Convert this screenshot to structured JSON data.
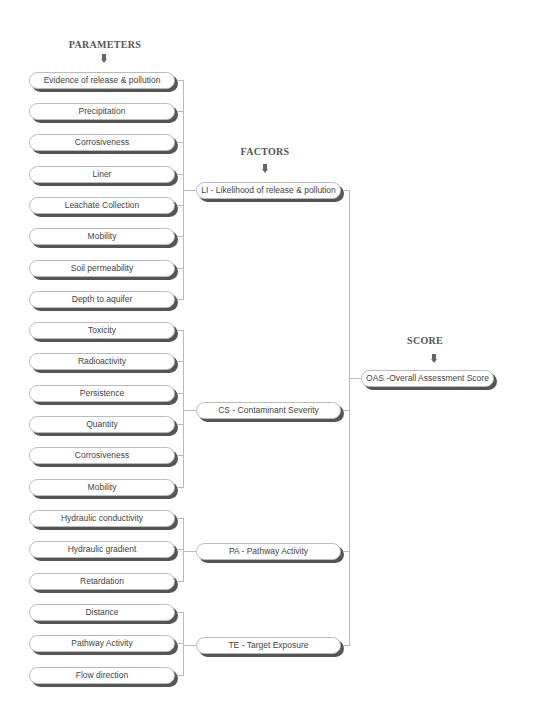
{
  "headings": {
    "parameters": "PARAMETERS",
    "factors": "FACTORS",
    "score": "SCORE"
  },
  "parameters": [
    {
      "label": "Evidence of release & pollution",
      "group": "LI"
    },
    {
      "label": "Precipitation",
      "group": "LI"
    },
    {
      "label": "Corrosiveness",
      "group": "LI"
    },
    {
      "label": "Liner",
      "group": "LI"
    },
    {
      "label": "Leachate Collection",
      "group": "LI"
    },
    {
      "label": "Mobility",
      "group": "LI"
    },
    {
      "label": "Soil permeability",
      "group": "LI"
    },
    {
      "label": "Depth to aquifer",
      "group": "LI"
    },
    {
      "label": "Toxicity",
      "group": "CS"
    },
    {
      "label": "Radioactivity",
      "group": "CS"
    },
    {
      "label": "Persistence",
      "group": "CS"
    },
    {
      "label": "Quantity",
      "group": "CS"
    },
    {
      "label": "Corrosiveness",
      "group": "CS"
    },
    {
      "label": "Mobility",
      "group": "CS"
    },
    {
      "label": "Hydraulic conductivity",
      "group": "PA"
    },
    {
      "label": "Hydraulic gradient",
      "group": "PA"
    },
    {
      "label": "Retardation",
      "group": "PA"
    },
    {
      "label": "Distance",
      "group": "TE"
    },
    {
      "label": "Pathway Activity",
      "group": "TE"
    },
    {
      "label": "Flow direction",
      "group": "TE"
    }
  ],
  "factors": [
    {
      "id": "LI",
      "label": "LI - Likelihood of release & pollution"
    },
    {
      "id": "CS",
      "label": "CS - Contaminant Severity"
    },
    {
      "id": "PA",
      "label": "PA - Pathway Activity"
    },
    {
      "id": "TE",
      "label": "TE - Target Exposure"
    }
  ],
  "score": {
    "id": "OAS",
    "label": "OAS -Overall Assessment Score"
  },
  "icons": {
    "down_arrow": "down-arrow-icon"
  }
}
